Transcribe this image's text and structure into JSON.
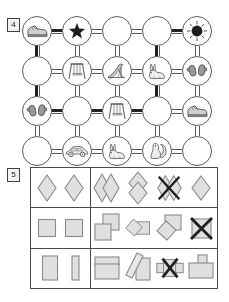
{
  "page": {
    "width": 229,
    "height": 302,
    "background": "#ffffff",
    "line_color": "#5a5a5a",
    "route_color": "#232323",
    "shape_fill": "#e0e0e0",
    "shape_stroke": "#8a8a8a"
  },
  "exercise_4": {
    "number": "4",
    "type": "maze-route-grid",
    "grid": {
      "columns": 5,
      "rows": 4
    },
    "nodes": [
      {
        "row": 1,
        "col": 1,
        "icon": "sneaker-icon",
        "label": "sneaker"
      },
      {
        "row": 1,
        "col": 2,
        "icon": "star-icon",
        "label": "star"
      },
      {
        "row": 1,
        "col": 3,
        "icon": "empty",
        "label": ""
      },
      {
        "row": 1,
        "col": 4,
        "icon": "empty",
        "label": ""
      },
      {
        "row": 1,
        "col": 5,
        "icon": "sun-dot-icon",
        "label": "sun"
      },
      {
        "row": 2,
        "col": 1,
        "icon": "empty",
        "label": ""
      },
      {
        "row": 2,
        "col": 2,
        "icon": "swing-icon",
        "label": "swing"
      },
      {
        "row": 2,
        "col": 3,
        "icon": "slide-icon",
        "label": "slide"
      },
      {
        "row": 2,
        "col": 4,
        "icon": "rabbit-icon",
        "label": "rabbit"
      },
      {
        "row": 2,
        "col": 5,
        "icon": "mittens-icon",
        "label": "mittens"
      },
      {
        "row": 3,
        "col": 1,
        "icon": "mittens-icon",
        "label": "mittens"
      },
      {
        "row": 3,
        "col": 2,
        "icon": "empty",
        "label": ""
      },
      {
        "row": 3,
        "col": 3,
        "icon": "swing-icon",
        "label": "swing"
      },
      {
        "row": 3,
        "col": 4,
        "icon": "empty",
        "label": ""
      },
      {
        "row": 3,
        "col": 5,
        "icon": "sneaker-icon",
        "label": "sneaker"
      },
      {
        "row": 4,
        "col": 1,
        "icon": "empty",
        "label": ""
      },
      {
        "row": 4,
        "col": 2,
        "icon": "car-icon",
        "label": "car"
      },
      {
        "row": 4,
        "col": 3,
        "icon": "rabbit-icon",
        "label": "rabbit"
      },
      {
        "row": 4,
        "col": 4,
        "icon": "squirrel-icon",
        "label": "squirrel"
      },
      {
        "row": 4,
        "col": 5,
        "icon": "empty",
        "label": ""
      }
    ],
    "route_description": "From sneaker (r1c1) right to star (r1c2); down column 1 to mittens (r3c1); right along row 3 to column 4; up column 4 to row 1; right to sun (r1c5)."
  },
  "exercise_5": {
    "number": "5",
    "type": "shape-matching-rows",
    "rows": [
      {
        "key_shapes": [
          {
            "shape": "diamond",
            "state": "plain"
          },
          {
            "shape": "diamond",
            "state": "plain"
          }
        ],
        "items": [
          {
            "shape": "two-diamonds-overlapping-horizontal",
            "crossed_out": false
          },
          {
            "shape": "two-diamonds-overlapping-vertical",
            "crossed_out": false
          },
          {
            "shape": "two-diamonds-overlapping-horizontal",
            "crossed_out": true
          },
          {
            "shape": "single-diamond",
            "crossed_out": false
          }
        ]
      },
      {
        "key_shapes": [
          {
            "shape": "square",
            "state": "plain"
          },
          {
            "shape": "square",
            "state": "plain"
          }
        ],
        "items": [
          {
            "shape": "two-squares-overlapping-offset",
            "crossed_out": false
          },
          {
            "shape": "diamond-over-square",
            "crossed_out": false
          },
          {
            "shape": "square-over-diamond",
            "crossed_out": false
          },
          {
            "shape": "single-square",
            "crossed_out": true
          }
        ]
      },
      {
        "key_shapes": [
          {
            "shape": "rectangle-wide",
            "state": "plain"
          },
          {
            "shape": "rectangle-narrow",
            "state": "plain"
          }
        ],
        "items": [
          {
            "shape": "two-rectangles-stacked",
            "crossed_out": false
          },
          {
            "shape": "tilted-rectangle-over-rectangle",
            "crossed_out": false
          },
          {
            "shape": "rectangles-side-by-side",
            "crossed_out": true
          },
          {
            "shape": "small-rect-over-wide-rect",
            "crossed_out": false
          }
        ]
      }
    ]
  }
}
